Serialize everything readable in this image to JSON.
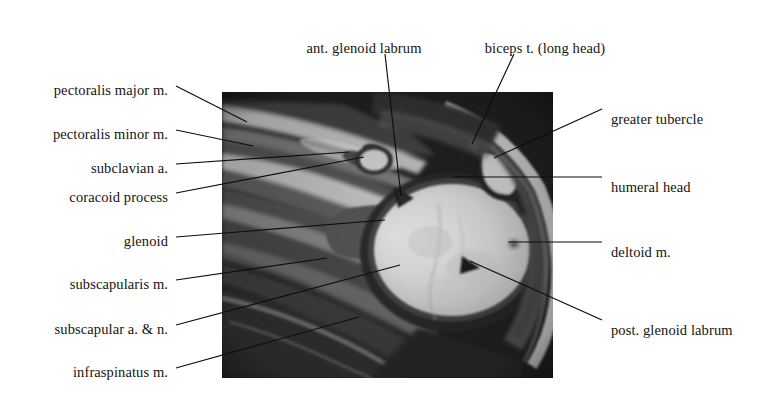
{
  "figure": {
    "kind": "labeled-mri-scan",
    "modality": "MRI",
    "view": "axial shoulder",
    "background_color": "#ffffff",
    "text_color": "#141414",
    "leader_line_color": "#0d0d0d"
  },
  "scan": {
    "name": "axial-shoulder-mri",
    "x": 222,
    "y": 92,
    "width": 331,
    "height": 286,
    "dark_tone": "#151515",
    "mid_tone": "#565656",
    "bright_tone": "#ededed",
    "fat_tone": "#d8d8d8"
  },
  "labels": [
    {
      "id": "pectoralis-major",
      "text": "pectoralis major m.",
      "side": "left",
      "text_x": 168,
      "text_y": 83,
      "line": [
        [
          176,
          86
        ],
        [
          247,
          122
        ]
      ]
    },
    {
      "id": "pectoralis-minor",
      "text": "pectoralis minor m.",
      "side": "left",
      "text_x": 168,
      "text_y": 127,
      "line": [
        [
          176,
          130
        ],
        [
          253,
          146
        ]
      ]
    },
    {
      "id": "subclavian-artery",
      "text": "subclavian a.",
      "side": "left",
      "text_x": 168,
      "text_y": 161,
      "line": [
        [
          176,
          164
        ],
        [
          349,
          152
        ]
      ]
    },
    {
      "id": "coracoid-process",
      "text": "coracoid process",
      "side": "left",
      "text_x": 168,
      "text_y": 190,
      "line": [
        [
          176,
          193
        ],
        [
          364,
          157
        ]
      ]
    },
    {
      "id": "glenoid",
      "text": "glenoid",
      "side": "left",
      "text_x": 168,
      "text_y": 234,
      "line": [
        [
          176,
          237
        ],
        [
          385,
          220
        ]
      ]
    },
    {
      "id": "subscapularis",
      "text": "subscapularis m.",
      "side": "left",
      "text_x": 168,
      "text_y": 277,
      "line": [
        [
          176,
          280
        ],
        [
          327,
          258
        ]
      ]
    },
    {
      "id": "subscapular-artery-nerve",
      "text": "subscapular a. & n.",
      "side": "left",
      "text_x": 168,
      "text_y": 322,
      "line": [
        [
          176,
          325
        ],
        [
          400,
          265
        ]
      ]
    },
    {
      "id": "infraspinatus",
      "text": "infraspinatus m.",
      "side": "left",
      "text_x": 168,
      "text_y": 365,
      "line": [
        [
          176,
          368
        ],
        [
          359,
          317
        ]
      ]
    },
    {
      "id": "ant-glenoid-labrum",
      "text": "ant. glenoid labrum",
      "side": "top",
      "text_x": 364,
      "text_y": 41,
      "line": [
        [
          385,
          54
        ],
        [
          401,
          196
        ]
      ]
    },
    {
      "id": "biceps-tendon-long-head",
      "text": "biceps t. (long head)",
      "side": "top",
      "text_x": 545,
      "text_y": 41,
      "line": [
        [
          514,
          54
        ],
        [
          472,
          144
        ]
      ]
    },
    {
      "id": "greater-tubercle",
      "text": "greater tubercle",
      "side": "right",
      "text_x": 611,
      "text_y": 112,
      "line": [
        [
          602,
          109
        ],
        [
          494,
          158
        ]
      ]
    },
    {
      "id": "humeral-head",
      "text": "humeral head",
      "side": "right",
      "text_x": 611,
      "text_y": 180,
      "line": [
        [
          602,
          177
        ],
        [
          452,
          177
        ]
      ]
    },
    {
      "id": "deltoid",
      "text": "deltoid m.",
      "side": "right",
      "text_x": 611,
      "text_y": 245,
      "line": [
        [
          602,
          242
        ],
        [
          508,
          242
        ]
      ]
    },
    {
      "id": "post-glenoid-labrum",
      "text": "post. glenoid labrum",
      "side": "right",
      "text_x": 611,
      "text_y": 323,
      "line": [
        [
          602,
          320
        ],
        [
          470,
          261
        ]
      ]
    }
  ]
}
